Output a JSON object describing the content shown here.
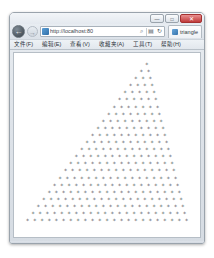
{
  "window": {
    "controls": {
      "minimize_label": "—",
      "maximize_label": "□",
      "close_label": "✕"
    }
  },
  "navigation": {
    "back_icon": "←",
    "forward_icon": "→",
    "site_icon": "page-icon",
    "url": "http://localhost:80",
    "search_icon": "⌕",
    "compat_icon": "▤",
    "refresh_icon": "↻"
  },
  "tab": {
    "favicon": "page-icon",
    "title": "triangle"
  },
  "menu": {
    "items": [
      {
        "label": "文件(F)"
      },
      {
        "label": "编辑(E)"
      },
      {
        "label": "查看(V)"
      },
      {
        "label": "收藏夹(A)"
      },
      {
        "label": "工具(T)"
      },
      {
        "label": "帮助(H)"
      }
    ]
  },
  "content": {
    "description": "asterisk triangle pattern",
    "rows": 23,
    "glyph": "*",
    "text": "                      *\n                     * *\n                    * * *\n                   * * * *\n                  * * * * *\n                 * * * * * *\n                * * * * * * *\n               * * * * * * * *\n              * * * * * * * * *\n             * * * * * * * * * *\n            * * * * * * * * * * *\n           * * * * * * * * * * * *\n          * * * * * * * * * * * * *\n         * * * * * * * * * * * * * *\n        * * * * * * * * * * * * * * *\n       * * * * * * * * * * * * * * * *\n      * * * * * * * * * * * * * * * * *\n     * * * * * * * * * * * * * * * * * *\n    * * * * * * * * * * * * * * * * * * *\n   * * * * * * * * * * * * * * * * * * * *\n  * * * * * * * * * * * * * * * * * * * * *\n * * * * * * * * * * * * * * * * * * * * * *\n* * * * * * * * * * * * * * * * * * * * * * *"
  }
}
